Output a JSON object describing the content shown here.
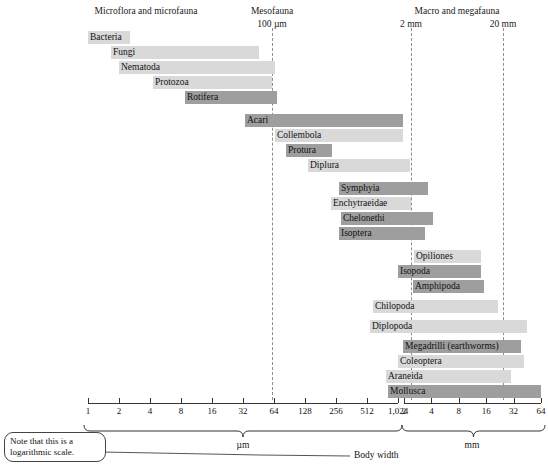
{
  "headers": [
    {
      "label": "Microflora and microfauna",
      "x": 146,
      "y": 6
    },
    {
      "label": "Mesofauna",
      "x": 272,
      "y": 6
    },
    {
      "label": "100 µm",
      "x": 272,
      "y": 19
    },
    {
      "label": "Macro and megafauna",
      "x": 457,
      "y": 6
    },
    {
      "label": "2 mm",
      "x": 411,
      "y": 19
    },
    {
      "label": "20 mm",
      "x": 503,
      "y": 19
    }
  ],
  "reference_lines": [
    {
      "name": "100-micrometre-line",
      "x": 272,
      "y1": 28,
      "y2": 400
    },
    {
      "name": "2-millimetre-line",
      "x": 411,
      "y1": 28,
      "y2": 400
    },
    {
      "name": "20-millimetre-line",
      "x": 503,
      "y1": 28,
      "y2": 400
    }
  ],
  "axis": {
    "micrometre": {
      "line_x1": 88,
      "line_x2": 398,
      "y": 403,
      "ticks": [
        "1",
        "2",
        "4",
        "8",
        "16",
        "32",
        "64",
        "128",
        "256",
        "512",
        "1,024"
      ],
      "unit": "µm"
    },
    "millimetre": {
      "line_x1": 404,
      "line_x2": 541,
      "y": 403,
      "ticks": [
        "2",
        "4",
        "8",
        "16",
        "32",
        "64"
      ],
      "unit": "mm"
    }
  },
  "note": {
    "text": "Note that this is a logarithmic scale.",
    "callout_label": "Body width"
  },
  "chart_data": {
    "type": "bar",
    "xlabel": "Body width",
    "ylabel": "",
    "scale": "logarithmic",
    "xunits": [
      "µm",
      "mm"
    ],
    "x_ticks_micrometre": [
      1,
      2,
      4,
      8,
      16,
      32,
      64,
      128,
      256,
      512,
      1024
    ],
    "x_ticks_millimetre": [
      2,
      4,
      8,
      16,
      32,
      64
    ],
    "grid": false,
    "legend": "none",
    "group_headers": [
      "Microflora and microfauna",
      "Mesofauna",
      "Macro and megafauna"
    ],
    "reference_values": [
      "100 µm",
      "2 mm",
      "20 mm"
    ],
    "annotations": [
      "Note that this is a logarithmic scale.",
      "Body width"
    ],
    "categories": [
      "Bacteria",
      "Fungi",
      "Nematoda",
      "Protozoa",
      "Rotifera",
      "Acari",
      "Collembola",
      "Protura",
      "Diplura",
      "Symphyia",
      "Enchytraeidae",
      "Chelonethi",
      "Isoptera",
      "Opiliones",
      "Isopoda",
      "Amphipoda",
      "Chilopoda",
      "Diplopoda",
      "Megadrilli (earthworms)",
      "Coleoptera",
      "Araneida",
      "Mollusca"
    ],
    "bars": [
      {
        "label": "Bacteria",
        "shade": "light",
        "x1": 88,
        "x2": 130,
        "y": 31,
        "label_align": "left"
      },
      {
        "label": "Fungi",
        "shade": "light",
        "x1": 111,
        "x2": 259,
        "y": 46,
        "label_align": "left"
      },
      {
        "label": "Nematoda",
        "shade": "light",
        "x1": 119,
        "x2": 275,
        "y": 61,
        "label_align": "left"
      },
      {
        "label": "Protozoa",
        "shade": "light",
        "x1": 153,
        "x2": 272,
        "y": 76,
        "label_align": "left"
      },
      {
        "label": "Rotifera",
        "shade": "dark",
        "x1": 185,
        "x2": 277,
        "y": 91,
        "label_align": "left"
      },
      {
        "label": "Acari",
        "shade": "dark",
        "x1": 245,
        "x2": 403,
        "y": 114,
        "label_align": "left"
      },
      {
        "label": "Collembola",
        "shade": "light",
        "x1": 275,
        "x2": 403,
        "y": 129,
        "label_align": "left"
      },
      {
        "label": "Protura",
        "shade": "dark",
        "x1": 286,
        "x2": 332,
        "y": 144,
        "label_align": "left"
      },
      {
        "label": "Diplura",
        "shade": "light",
        "x1": 308,
        "x2": 410,
        "y": 159,
        "label_align": "left"
      },
      {
        "label": "Symphyia",
        "shade": "dark",
        "x1": 339,
        "x2": 428,
        "y": 182,
        "label_align": "left"
      },
      {
        "label": "Enchytraeidae",
        "shade": "light",
        "x1": 331,
        "x2": 411,
        "y": 197,
        "label_align": "left"
      },
      {
        "label": "Chelonethi",
        "shade": "dark",
        "x1": 341,
        "x2": 433,
        "y": 212,
        "label_align": "left"
      },
      {
        "label": "Isoptera",
        "shade": "dark",
        "x1": 339,
        "x2": 425,
        "y": 227,
        "label_align": "left"
      },
      {
        "label": "Opiliones",
        "shade": "light",
        "x1": 414,
        "x2": 481,
        "y": 250,
        "label_align": "left"
      },
      {
        "label": "Isopoda",
        "shade": "dark",
        "x1": 398,
        "x2": 481,
        "y": 265,
        "label_align": "left"
      },
      {
        "label": "Amphipoda",
        "shade": "dark",
        "x1": 413,
        "x2": 484,
        "y": 280,
        "label_align": "left"
      },
      {
        "label": "Chilopoda",
        "shade": "light",
        "x1": 373,
        "x2": 498,
        "y": 300,
        "label_align": "left"
      },
      {
        "label": "Diplopoda",
        "shade": "light",
        "x1": 370,
        "x2": 527,
        "y": 320,
        "label_align": "left"
      },
      {
        "label": "Megadrilli (earthworms)",
        "shade": "dark",
        "x1": 403,
        "x2": 521,
        "y": 340,
        "label_align": "left"
      },
      {
        "label": "Coleoptera",
        "shade": "light",
        "x1": 398,
        "x2": 524,
        "y": 355,
        "label_align": "left"
      },
      {
        "label": "Araneida",
        "shade": "light",
        "x1": 386,
        "x2": 511,
        "y": 370,
        "label_align": "left"
      },
      {
        "label": "Mollusca",
        "shade": "dark",
        "x1": 388,
        "x2": 541,
        "y": 385,
        "label_align": "left"
      }
    ]
  }
}
